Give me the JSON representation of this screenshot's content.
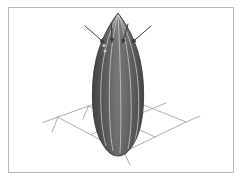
{
  "viewport": {
    "title": "3D Surface Viewport",
    "width": 243,
    "height": 181,
    "background_color": "#ffffff",
    "frame_color": "#b9b9b9"
  },
  "scene": {
    "name": "surface-of-revolution-with-normal-arrows",
    "description": "Shaded bullet-shaped surface of revolution standing on a perspective ground grid with four annotation arrows pointing at its upper region"
  },
  "surface": {
    "name": "bullet-solid",
    "label": "surface of revolution",
    "fill_dark": "#4a4a4a",
    "fill_mid": "#6e6e6e",
    "fill_light": "#8a8a8a",
    "outline_color": "#3a3a3a",
    "meridian_color": "#cfcfcf",
    "apex": {
      "x": 118,
      "y": 13
    },
    "base": {
      "x": 118,
      "y": 156
    },
    "max_width": 46,
    "meridian_count": 5
  },
  "grid": {
    "name": "ground-plane-grid",
    "line_color": "#9a9a9a",
    "cells_u": 2,
    "cells_v": 2,
    "corners": [
      {
        "x": 58,
        "y": 117
      },
      {
        "x": 119,
        "y": 95
      },
      {
        "x": 186,
        "y": 122
      },
      {
        "x": 124,
        "y": 152
      }
    ],
    "extensions": [
      {
        "from": {
          "x": 58,
          "y": 117
        },
        "to": {
          "x": 44,
          "y": 122
        }
      },
      {
        "from": {
          "x": 186,
          "y": 122
        },
        "to": {
          "x": 199,
          "y": 117
        }
      },
      {
        "from": {
          "x": 58,
          "y": 117
        },
        "to": {
          "x": 53,
          "y": 131
        }
      },
      {
        "from": {
          "x": 124,
          "y": 152
        },
        "to": {
          "x": 129,
          "y": 164
        }
      }
    ]
  },
  "arrows": {
    "name": "normal-vector-arrows",
    "color": "#3c3c3c",
    "count": 4,
    "items": [
      {
        "label": "arrow-left-outer",
        "from": {
          "x": 86,
          "y": 27
        },
        "to": {
          "x": 104,
          "y": 42
        }
      },
      {
        "label": "arrow-left-inner",
        "from": {
          "x": 112,
          "y": 25
        },
        "to": {
          "x": 112,
          "y": 42
        }
      },
      {
        "label": "arrow-right-inner",
        "from": {
          "x": 127,
          "y": 25
        },
        "to": {
          "x": 122,
          "y": 43
        }
      },
      {
        "label": "arrow-right-outer",
        "from": {
          "x": 150,
          "y": 27
        },
        "to": {
          "x": 132,
          "y": 42
        }
      }
    ]
  },
  "markers": {
    "name": "surface-point-markers",
    "color": "#d8d8d8",
    "items": [
      {
        "label": "marker-a",
        "x": 104,
        "y": 45
      },
      {
        "label": "marker-b",
        "x": 105,
        "y": 51
      }
    ]
  }
}
